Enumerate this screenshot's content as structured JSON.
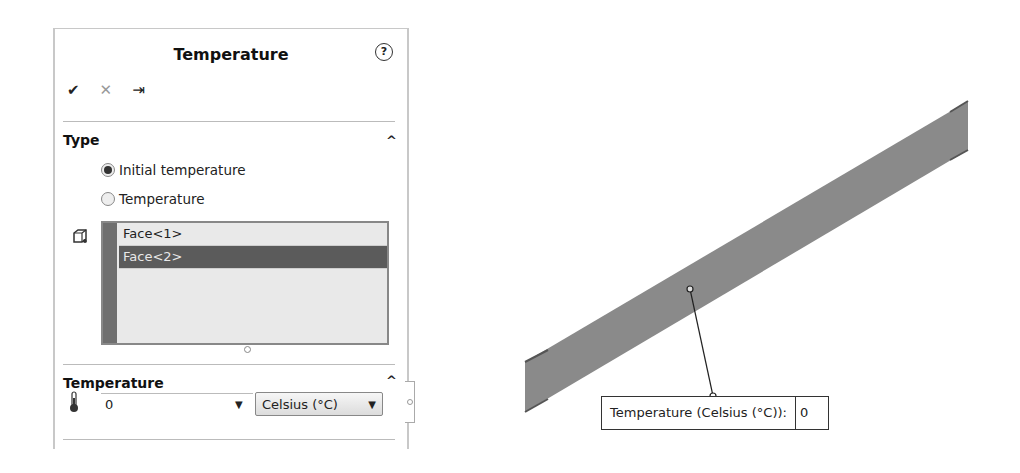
{
  "panel": {
    "title": "Temperature",
    "help_icon": "?",
    "actions": {
      "ok_icon": "✔",
      "cancel_icon": "✕",
      "pin_icon": "⇥"
    },
    "type_section": {
      "title": "Type",
      "collapse_icon": "^",
      "options": [
        {
          "label": "Initial temperature",
          "selected": true
        },
        {
          "label": "Temperature",
          "selected": false
        }
      ],
      "selection_list": {
        "icon": "face-selection-icon",
        "items": [
          {
            "label": "Face<1>",
            "selected": false
          },
          {
            "label": "Face<2>",
            "selected": true
          }
        ]
      }
    },
    "temperature_section": {
      "title": "Temperature",
      "collapse_icon": "^",
      "icon": "thermometer-icon",
      "value": "0",
      "value_dropdown_icon": "▼",
      "unit": "Celsius (°C)",
      "unit_dropdown_icon": "▼"
    }
  },
  "viewport": {
    "model_color": "#8a8a8a",
    "callout": {
      "label": "Temperature (Celsius (°C)):",
      "value": "0"
    }
  }
}
